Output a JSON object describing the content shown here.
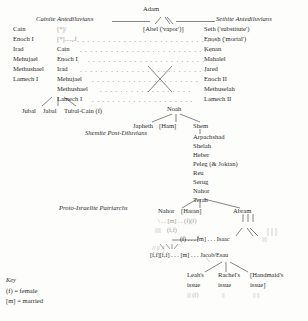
{
  "figure": {
    "root": "Adam",
    "key_title": "Key",
    "key_items": [
      "(f) = female",
      "[m] = married"
    ]
  },
  "sections": {
    "cainite_heading": "Cainite Antediluvians",
    "sethite_heading": "Sethite Antediluvians",
    "shemite_heading": "Shemite Post-Diluvians",
    "patriarch_heading": "Proto-Israelite Patriarchs"
  },
  "top_children": {
    "abel": "[Abel ('vapor')]",
    "seth": "Seth ('substitute')"
  },
  "cainite_column": [
    "Cain",
    "Enoch I",
    "Irad",
    "Mehujael",
    "Methushael",
    "Lamech I"
  ],
  "cainite_mirror": [
    "[*]/",
    "[*]......f",
    "Cain",
    "Enoch I",
    "Irad",
    "Mehujael",
    "Methushael",
    "Lamech I"
  ],
  "sethite_column": [
    "Enosh ('mortal')",
    "Kenan",
    "Mahalel",
    "Jared",
    "Enoch II",
    "Methuselah",
    "Lamech II",
    "Noah"
  ],
  "lamech_children": [
    "Jubal",
    "Jabal",
    "Tubal-Cain (f)"
  ],
  "noah_sons": [
    "Japheth",
    "[Ham]",
    "Shem"
  ],
  "shemite_column": [
    "Shem",
    "Arpachshad",
    "Shelah",
    "Heber",
    "Peleg (& Joktan)",
    "Reu",
    "Serug",
    "Nahor",
    "Terah"
  ],
  "terah_sons": {
    "nahor": "Nahor",
    "haran": "[Haran]",
    "abram": "Abram"
  },
  "patriarch_rows": {
    "row1": "\\ . . [m] . . (f)(f)",
    "row2": "(f,f)",
    "row3": "(f) . . . [m] . . . Isaac",
    "row4": "[f,f][f,f] . . . [m] . . . Jacob/Esau"
  },
  "issue_groups": [
    {
      "line1": "Leah's",
      "line2": "issue"
    },
    {
      "line1": "Rachel's",
      "line2": "issue"
    },
    {
      "line1": "[Handmaid's",
      "line2": "issue]"
    }
  ],
  "issue_marks": [
    "||| (f)",
    "||",
    "|| ||"
  ]
}
